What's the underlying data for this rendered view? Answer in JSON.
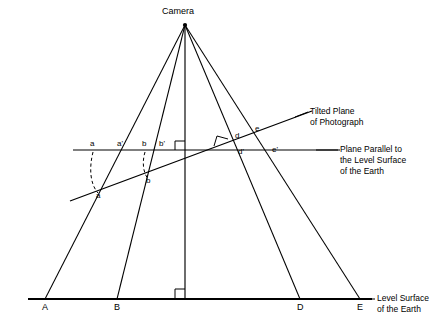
{
  "figure": {
    "camera_label": "Camera",
    "background_color": "#ffffff",
    "line_color": "#000000"
  },
  "annotations": {
    "tilted_plane": "Tilted Plane\nof Photograph",
    "tilted_plane_line1": "Tilted Plane",
    "tilted_plane_line2": "of Photograph",
    "parallel_plane_line1": "Plane Parallel to",
    "parallel_plane_line2": "the Level Surface",
    "parallel_plane_line3": "of the Earth",
    "ground_line1": "Level Surface",
    "ground_line2": "of the Earth"
  },
  "ground_points": [
    {
      "label": "A",
      "x": 45,
      "y": 299
    },
    {
      "label": "B",
      "x": 117,
      "y": 299
    },
    {
      "label": "D",
      "x": 300,
      "y": 299
    },
    {
      "label": "E",
      "x": 360,
      "y": 299
    }
  ],
  "horizontal_plane_points": [
    {
      "label": "a",
      "x": 93,
      "y": 150
    },
    {
      "label": "a'",
      "x": 120,
      "y": 150
    },
    {
      "label": "b",
      "x": 145,
      "y": 150
    },
    {
      "label": "b'",
      "x": 163,
      "y": 150
    },
    {
      "label": "d'",
      "x": 241,
      "y": 150
    },
    {
      "label": "e'",
      "x": 275,
      "y": 150
    }
  ],
  "tilted_plane_points": [
    {
      "label": "a",
      "x": 98,
      "y": 193
    },
    {
      "label": "b",
      "x": 148,
      "y": 178
    },
    {
      "label": "d",
      "x": 238,
      "y": 139
    },
    {
      "label": "e",
      "x": 258,
      "y": 132
    }
  ],
  "camera": {
    "label": "Camera",
    "x": 185,
    "y": 25
  },
  "geometry": {
    "ground_y": 299,
    "horizontal_plane_y": 150,
    "vertical_axis_x": 185,
    "tilted_plane_left": {
      "x": 70,
      "y": 201
    },
    "tilted_plane_right": {
      "x": 300,
      "y": 115
    }
  },
  "right_angle_markers": [
    {
      "name": "axis-ground-right-angle",
      "x": 185,
      "y": 299
    },
    {
      "name": "axis-horizontal-plane-right-angle",
      "x": 185,
      "y": 150
    },
    {
      "name": "axis-tilted-plane-right-angle",
      "x": 222,
      "y": 142
    }
  ]
}
